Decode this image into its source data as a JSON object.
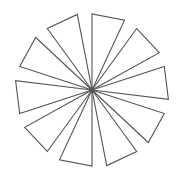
{
  "figure": {
    "background": "#ffffff",
    "stroke_color": "#555555",
    "stroke_width": 1.1,
    "center": [
      92,
      90
    ],
    "triangle_count": 10,
    "tip_radius": 76,
    "second_radius": 77,
    "start_angle_deg": -90,
    "step_angle_deg": 36,
    "offset_angle_deg": 25
  }
}
